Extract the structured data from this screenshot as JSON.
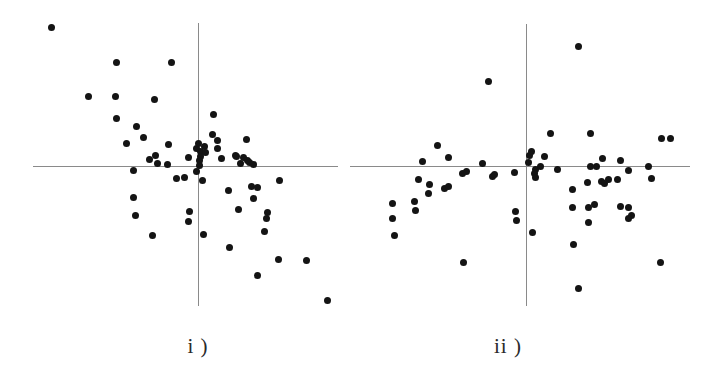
{
  "figure": {
    "width": 705,
    "height": 376,
    "background": "#ffffff",
    "point_color": "#141414",
    "axis_color": "#8a8a8a",
    "point_radius_px": 3.5
  },
  "chart_data": [
    {
      "type": "scatter",
      "title": "i )",
      "label": "i )",
      "label_position": {
        "x": 198,
        "y": 334
      },
      "xlabel": "",
      "ylabel": "",
      "grid": false,
      "legend": null,
      "axes": {
        "horizontal": {
          "x1": 33,
          "x2": 338,
          "y": 166
        },
        "vertical": {
          "x": 198,
          "y1": 23,
          "y2": 306
        }
      },
      "origin": {
        "x": 198,
        "y": 166
      },
      "n_points": 62,
      "points": [
        {
          "x": 51,
          "y": 27
        },
        {
          "x": 116,
          "y": 62
        },
        {
          "x": 171,
          "y": 62
        },
        {
          "x": 88,
          "y": 96
        },
        {
          "x": 115,
          "y": 96
        },
        {
          "x": 154,
          "y": 99
        },
        {
          "x": 116,
          "y": 118
        },
        {
          "x": 136,
          "y": 126
        },
        {
          "x": 143,
          "y": 137
        },
        {
          "x": 126,
          "y": 143
        },
        {
          "x": 168,
          "y": 144
        },
        {
          "x": 155,
          "y": 155
        },
        {
          "x": 149,
          "y": 159
        },
        {
          "x": 188,
          "y": 157
        },
        {
          "x": 212,
          "y": 134
        },
        {
          "x": 217,
          "y": 140
        },
        {
          "x": 246,
          "y": 139
        },
        {
          "x": 217,
          "y": 148
        },
        {
          "x": 200,
          "y": 151
        },
        {
          "x": 200,
          "y": 156
        },
        {
          "x": 235,
          "y": 155
        },
        {
          "x": 240,
          "y": 163
        },
        {
          "x": 249,
          "y": 162
        },
        {
          "x": 253,
          "y": 164
        },
        {
          "x": 199,
          "y": 160
        },
        {
          "x": 199,
          "y": 165
        },
        {
          "x": 133,
          "y": 170
        },
        {
          "x": 176,
          "y": 178
        },
        {
          "x": 184,
          "y": 177
        },
        {
          "x": 202,
          "y": 180
        },
        {
          "x": 228,
          "y": 190
        },
        {
          "x": 251,
          "y": 186
        },
        {
          "x": 257,
          "y": 187
        },
        {
          "x": 279,
          "y": 180
        },
        {
          "x": 133,
          "y": 197
        },
        {
          "x": 135,
          "y": 215
        },
        {
          "x": 189,
          "y": 211
        },
        {
          "x": 188,
          "y": 221
        },
        {
          "x": 238,
          "y": 209
        },
        {
          "x": 253,
          "y": 198
        },
        {
          "x": 203,
          "y": 234
        },
        {
          "x": 152,
          "y": 235
        },
        {
          "x": 267,
          "y": 212
        },
        {
          "x": 266,
          "y": 218
        },
        {
          "x": 229,
          "y": 247
        },
        {
          "x": 264,
          "y": 231
        },
        {
          "x": 278,
          "y": 259
        },
        {
          "x": 306,
          "y": 260
        },
        {
          "x": 257,
          "y": 275
        },
        {
          "x": 327,
          "y": 300
        },
        {
          "x": 213,
          "y": 114
        },
        {
          "x": 221,
          "y": 158
        },
        {
          "x": 236,
          "y": 156
        },
        {
          "x": 243,
          "y": 157
        },
        {
          "x": 247,
          "y": 160
        },
        {
          "x": 204,
          "y": 146
        },
        {
          "x": 205,
          "y": 152
        },
        {
          "x": 196,
          "y": 148
        },
        {
          "x": 198,
          "y": 143
        },
        {
          "x": 167,
          "y": 164
        },
        {
          "x": 157,
          "y": 163
        },
        {
          "x": 196,
          "y": 171
        }
      ]
    },
    {
      "type": "scatter",
      "title": "ii )",
      "label": "ii )",
      "label_position": {
        "x": 508,
        "y": 334
      },
      "xlabel": "",
      "ylabel": "",
      "grid": false,
      "legend": null,
      "axes": {
        "horizontal": {
          "x1": 350,
          "x2": 690,
          "y": 166
        },
        "vertical": {
          "x": 526,
          "y1": 24,
          "y2": 306
        }
      },
      "origin": {
        "x": 526,
        "y": 166
      },
      "n_points": 62,
      "points": [
        {
          "x": 578,
          "y": 46
        },
        {
          "x": 488,
          "y": 81
        },
        {
          "x": 437,
          "y": 145
        },
        {
          "x": 448,
          "y": 157
        },
        {
          "x": 422,
          "y": 161
        },
        {
          "x": 462,
          "y": 173
        },
        {
          "x": 466,
          "y": 171
        },
        {
          "x": 482,
          "y": 163
        },
        {
          "x": 514,
          "y": 172
        },
        {
          "x": 550,
          "y": 133
        },
        {
          "x": 590,
          "y": 133
        },
        {
          "x": 661,
          "y": 138
        },
        {
          "x": 670,
          "y": 138
        },
        {
          "x": 602,
          "y": 158
        },
        {
          "x": 557,
          "y": 169
        },
        {
          "x": 628,
          "y": 170
        },
        {
          "x": 535,
          "y": 169
        },
        {
          "x": 534,
          "y": 173
        },
        {
          "x": 587,
          "y": 182
        },
        {
          "x": 601,
          "y": 181
        },
        {
          "x": 604,
          "y": 183
        },
        {
          "x": 528,
          "y": 162
        },
        {
          "x": 529,
          "y": 155
        },
        {
          "x": 531,
          "y": 151
        },
        {
          "x": 418,
          "y": 179
        },
        {
          "x": 429,
          "y": 184
        },
        {
          "x": 444,
          "y": 188
        },
        {
          "x": 448,
          "y": 186
        },
        {
          "x": 492,
          "y": 176
        },
        {
          "x": 494,
          "y": 174
        },
        {
          "x": 535,
          "y": 177
        },
        {
          "x": 572,
          "y": 189
        },
        {
          "x": 608,
          "y": 179
        },
        {
          "x": 617,
          "y": 179
        },
        {
          "x": 651,
          "y": 178
        },
        {
          "x": 572,
          "y": 207
        },
        {
          "x": 588,
          "y": 207
        },
        {
          "x": 594,
          "y": 204
        },
        {
          "x": 620,
          "y": 206
        },
        {
          "x": 628,
          "y": 207
        },
        {
          "x": 414,
          "y": 201
        },
        {
          "x": 428,
          "y": 193
        },
        {
          "x": 415,
          "y": 210
        },
        {
          "x": 392,
          "y": 203
        },
        {
          "x": 392,
          "y": 218
        },
        {
          "x": 394,
          "y": 235
        },
        {
          "x": 515,
          "y": 211
        },
        {
          "x": 516,
          "y": 220
        },
        {
          "x": 532,
          "y": 232
        },
        {
          "x": 588,
          "y": 222
        },
        {
          "x": 631,
          "y": 215
        },
        {
          "x": 628,
          "y": 218
        },
        {
          "x": 573,
          "y": 244
        },
        {
          "x": 463,
          "y": 262
        },
        {
          "x": 660,
          "y": 262
        },
        {
          "x": 578,
          "y": 288
        },
        {
          "x": 540,
          "y": 166
        },
        {
          "x": 544,
          "y": 156
        },
        {
          "x": 620,
          "y": 160
        },
        {
          "x": 648,
          "y": 166
        },
        {
          "x": 590,
          "y": 166
        },
        {
          "x": 596,
          "y": 166
        }
      ]
    }
  ]
}
